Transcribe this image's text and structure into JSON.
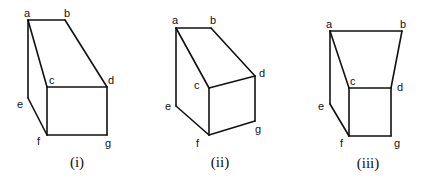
{
  "figures": [
    {
      "caption": "(i)",
      "caption_pos": [
        77,
        155
      ],
      "vertices": {
        "a": [
          28,
          20
        ],
        "b": [
          65,
          20
        ],
        "c": [
          47,
          87
        ],
        "d": [
          107,
          87
        ],
        "e": [
          28,
          98
        ],
        "f": [
          47,
          135
        ],
        "g": [
          107,
          135
        ]
      },
      "labels": {
        "a": {
          "text": "a",
          "pos": [
            24,
            8
          ]
        },
        "b": {
          "text": "b",
          "pos": [
            64,
            8
          ]
        },
        "c": {
          "text": "c",
          "pos": [
            49,
            75
          ]
        },
        "d": {
          "text": "d",
          "pos": [
            108,
            75
          ]
        },
        "e": {
          "text": "e",
          "pos": [
            17,
            99
          ]
        },
        "f": {
          "text": "f",
          "pos": [
            37,
            136
          ]
        },
        "g": {
          "text": "g",
          "pos": [
            105,
            138
          ]
        }
      },
      "edges": [
        [
          "a",
          "b"
        ],
        [
          "b",
          "d"
        ],
        [
          "a",
          "c"
        ],
        [
          "a",
          "e"
        ],
        [
          "c",
          "d"
        ],
        [
          "c",
          "f"
        ],
        [
          "d",
          "g"
        ],
        [
          "e",
          "f"
        ],
        [
          "f",
          "g"
        ]
      ]
    },
    {
      "caption": "(ii)",
      "caption_pos": [
        220,
        155
      ],
      "vertices": {
        "a": [
          176,
          28
        ],
        "b": [
          211,
          28
        ],
        "c": [
          209,
          88
        ],
        "d": [
          255,
          76
        ],
        "e": [
          176,
          106
        ],
        "f": [
          209,
          135
        ],
        "g": [
          255,
          121
        ]
      },
      "labels": {
        "a": {
          "text": "a",
          "pos": [
            172,
            15
          ]
        },
        "b": {
          "text": "b",
          "pos": [
            210,
            15
          ]
        },
        "c": {
          "text": "c",
          "pos": [
            194,
            80
          ]
        },
        "d": {
          "text": "d",
          "pos": [
            259,
            68
          ]
        },
        "e": {
          "text": "e",
          "pos": [
            165,
            101
          ]
        },
        "f": {
          "text": "f",
          "pos": [
            196,
            138
          ]
        },
        "g": {
          "text": "g",
          "pos": [
            255,
            124
          ]
        }
      },
      "edges": [
        [
          "a",
          "b"
        ],
        [
          "b",
          "d"
        ],
        [
          "a",
          "c"
        ],
        [
          "a",
          "e"
        ],
        [
          "c",
          "d"
        ],
        [
          "c",
          "f"
        ],
        [
          "d",
          "g"
        ],
        [
          "e",
          "f"
        ],
        [
          "f",
          "g"
        ]
      ]
    },
    {
      "caption": "(iii)",
      "caption_pos": [
        368,
        156
      ],
      "vertices": {
        "a": [
          330,
          31
        ],
        "b": [
          402,
          31
        ],
        "c": [
          349,
          88
        ],
        "d": [
          391,
          88
        ],
        "e": [
          330,
          104
        ],
        "f": [
          349,
          136
        ],
        "g": [
          391,
          136
        ]
      },
      "labels": {
        "a": {
          "text": "a",
          "pos": [
            326,
            19
          ]
        },
        "b": {
          "text": "b",
          "pos": [
            400,
            19
          ]
        },
        "c": {
          "text": "c",
          "pos": [
            350,
            76
          ]
        },
        "d": {
          "text": "d",
          "pos": [
            397,
            82
          ]
        },
        "e": {
          "text": "e",
          "pos": [
            318,
            101
          ]
        },
        "f": {
          "text": "f",
          "pos": [
            340,
            138
          ]
        },
        "g": {
          "text": "g",
          "pos": [
            394,
            138
          ]
        }
      },
      "edges": [
        [
          "a",
          "b"
        ],
        [
          "b",
          "d"
        ],
        [
          "a",
          "c"
        ],
        [
          "a",
          "e"
        ],
        [
          "c",
          "d"
        ],
        [
          "c",
          "f"
        ],
        [
          "d",
          "g"
        ],
        [
          "e",
          "f"
        ],
        [
          "f",
          "g"
        ]
      ]
    }
  ]
}
